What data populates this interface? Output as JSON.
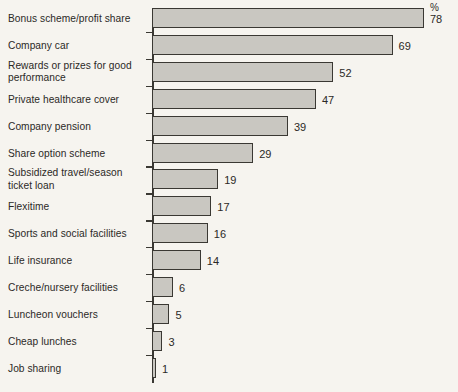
{
  "chart_data": {
    "type": "bar",
    "orientation": "horizontal",
    "title": "",
    "subtitle": "",
    "xlabel": "",
    "ylabel": "",
    "unit_label": "%",
    "xlim": [
      0,
      78
    ],
    "grid": false,
    "legend": null,
    "categories": [
      "Bonus scheme/profit share",
      "Company car",
      "Rewards or prizes for good performance",
      "Private healthcare cover",
      "Company pension",
      "Share option scheme",
      "Subsidized travel/season ticket loan",
      "Flexitime",
      "Sports and social facilities",
      "Life insurance",
      "Creche/nursery facilities",
      "Luncheon vouchers",
      "Cheap lunches",
      "Job sharing"
    ],
    "values": [
      78,
      69,
      52,
      47,
      39,
      29,
      19,
      17,
      16,
      14,
      6,
      5,
      3,
      1
    ],
    "data_labels": [
      "78",
      "69",
      "52",
      "47",
      "39",
      "29",
      "19",
      "17",
      "16",
      "14",
      "6",
      "5",
      "3",
      "1"
    ]
  },
  "style": {
    "background": "#f6f4ef",
    "bar_fill": "#c9c7c1",
    "bar_stroke": "#3a3833",
    "text_color": "#2b2926"
  }
}
